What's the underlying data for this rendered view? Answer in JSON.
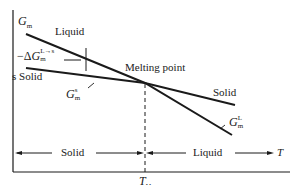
{
  "diagram": {
    "axes": {
      "y_label": {
        "symbol": "G",
        "subscript": "m"
      },
      "x_label": "T",
      "x_tick": {
        "symbol": "T",
        "subscript": "M"
      }
    },
    "curves": {
      "liquid_label": "Liquid",
      "solid_label_left": "s Solid",
      "solid_label_right": "Solid",
      "gs_label": {
        "symbol": "G",
        "subscript": "m",
        "superscript": "s"
      },
      "gl_label": {
        "symbol": "G",
        "subscript": "m",
        "superscript": "L"
      }
    },
    "annotations": {
      "melting_point": "Melting point",
      "delta_g": {
        "prefix": "−Δ",
        "symbol": "G",
        "subscript": "m",
        "superscript": "L→s"
      }
    },
    "regions": {
      "solid": "Solid",
      "liquid": "Liquid"
    },
    "colors": {
      "line": "#1a1a1a",
      "background": "#ffffff"
    }
  }
}
